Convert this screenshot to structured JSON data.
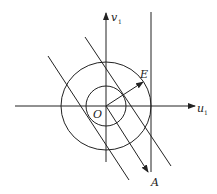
{
  "diagram": {
    "type": "geometric-vector-diagram",
    "labels": {
      "vertical_axis": "v",
      "vertical_axis_sub": "1",
      "horizontal_axis": "u",
      "horizontal_axis_sub": "1",
      "origin": "O",
      "point_e": "E",
      "point_a": "A"
    },
    "colors": {
      "stroke": "#222222",
      "background": "#ffffff"
    },
    "elements": [
      "vertical axis v1 with arrow",
      "horizontal axis u1 with arrow",
      "inner circle centered at O",
      "outer circle centered at O",
      "vertical line tangent to outer circle",
      "vector O to E",
      "vector O to A",
      "two diagonal lines parallel to OA"
    ]
  }
}
